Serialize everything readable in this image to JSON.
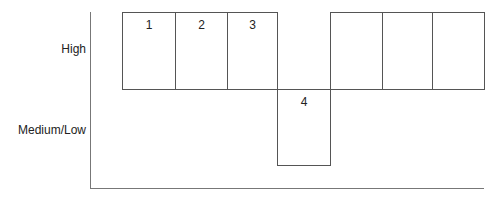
{
  "diagram": {
    "y_labels": {
      "high": "High",
      "medium_low": "Medium/Low"
    },
    "cells": [
      {
        "label": "1",
        "level": "high"
      },
      {
        "label": "2",
        "level": "high"
      },
      {
        "label": "3",
        "level": "high"
      },
      {
        "label": "4",
        "level": "medium_low"
      },
      {
        "label": "",
        "level": "high"
      },
      {
        "label": "",
        "level": "high"
      },
      {
        "label": "",
        "level": "high"
      }
    ]
  }
}
